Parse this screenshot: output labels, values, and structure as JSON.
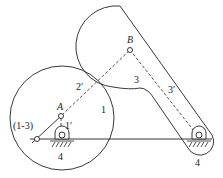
{
  "diagram": {
    "type": "mechanism",
    "labels": {
      "point_a": "A",
      "point_b": "B",
      "body_1": "1",
      "body_3": "3",
      "link_2p": "2′",
      "link_3p": "3′",
      "link_1p": "1′",
      "instant_center": "(1-3)",
      "ground_left": "4",
      "ground_right": "4"
    },
    "colors": {
      "stroke": "#222222",
      "background": "#ffffff"
    }
  }
}
